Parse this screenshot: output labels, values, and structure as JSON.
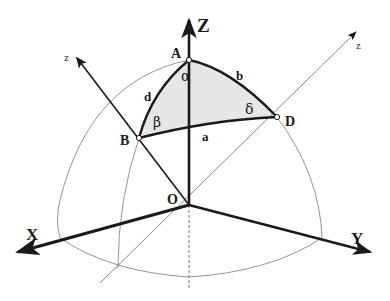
{
  "diagram": {
    "colors": {
      "ink": "#1a1a1a",
      "thin_line": "#7a7a7a",
      "shade": "#e6e6e6",
      "background": "#ffffff"
    },
    "axes": {
      "X": "X",
      "Y": "Y",
      "Z": "Z",
      "z_left": "z",
      "z_right": "z"
    },
    "points": {
      "A": "A",
      "B": "B",
      "D": "D",
      "O": "O"
    },
    "arcs": {
      "a": "a",
      "b": "b",
      "d": "d"
    },
    "angles": {
      "alpha": "α",
      "beta": "β",
      "delta": "δ"
    }
  }
}
